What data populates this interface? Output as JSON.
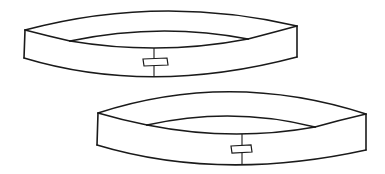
{
  "figure": {
    "description": "Line drawing of two paper headbands, each joined at the back with a strip of tape",
    "items": [
      {
        "label": "headband-upper"
      },
      {
        "label": "headband-lower"
      }
    ],
    "colors": {
      "line": "#1a1a1a",
      "background": "#ffffff"
    }
  }
}
